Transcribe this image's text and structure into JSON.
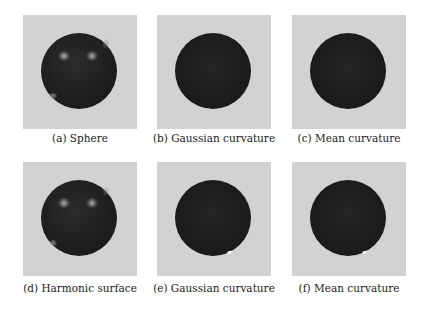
{
  "figure": {
    "panels": [
      {
        "id": "a",
        "caption": "(a) Sphere",
        "shading": "specular",
        "highlight": "none"
      },
      {
        "id": "b",
        "caption": "(b) Gaussian curvature",
        "shading": "flat",
        "highlight": "none"
      },
      {
        "id": "c",
        "caption": "(c) Mean curvature",
        "shading": "flat",
        "highlight": "none"
      },
      {
        "id": "d",
        "caption": "(d) Harmonic surface",
        "shading": "specular",
        "highlight": "none"
      },
      {
        "id": "e",
        "caption": "(e) Gaussian curvature",
        "shading": "flat",
        "highlight": "small-white-spot"
      },
      {
        "id": "f",
        "caption": "(f) Mean curvature",
        "shading": "flat",
        "highlight": "small-white-spot"
      }
    ],
    "colors": {
      "background": "#d2d2d2",
      "sphere": "#1c1c1c"
    }
  }
}
